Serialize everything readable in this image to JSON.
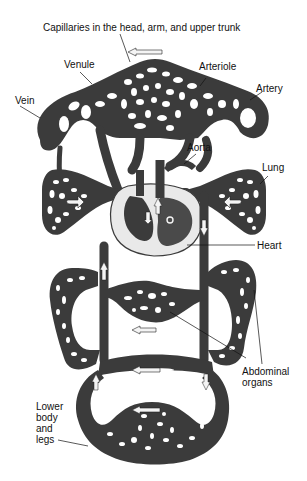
{
  "diagram": {
    "colors": {
      "background": "#ffffff",
      "vessel": "#3b3b3b",
      "vessel_dark": "#262626",
      "capillary_hole": "#ffffff",
      "heart_outline": "#e8e8e8",
      "arrow_fill": "#f4f4f4",
      "label_text": "#111111",
      "leader_line": "#111111"
    },
    "labels": {
      "capillaries": "Capillaries in the head, arm, and upper trunk",
      "venule": "Venule",
      "arteriole": "Arteriole",
      "vein": "Vein",
      "artery": "Artery",
      "aorta": "Aorta",
      "lung": "Lung",
      "heart": "Heart",
      "abdominal_organs": "Abdominal\norgans",
      "lower_body": "Lower\nbody\nand\nlegs"
    },
    "regions": [
      "upper body capillary bed",
      "left lung",
      "right lung",
      "heart",
      "abdominal organs (left loop)",
      "abdominal organs (central)",
      "abdominal organs (right loop)",
      "lower body and legs capillary bed"
    ],
    "flow_arrows": [
      {
        "location": "top",
        "direction": "left"
      },
      {
        "location": "abdomen center",
        "direction": "left"
      },
      {
        "location": "lower loop upper",
        "direction": "left"
      },
      {
        "location": "lower loop middle",
        "direction": "left"
      }
    ]
  }
}
